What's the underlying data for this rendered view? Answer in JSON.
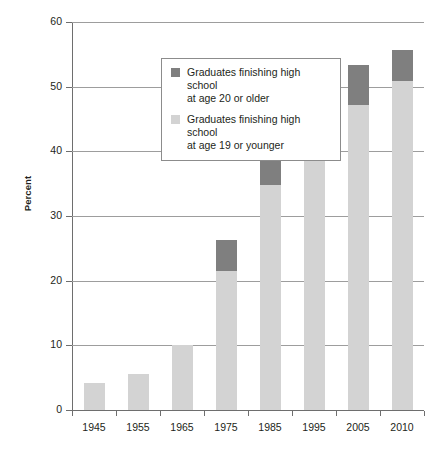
{
  "chart_data": {
    "type": "bar",
    "stacked": true,
    "title": "",
    "xlabel": "",
    "ylabel": "Percent",
    "ylim": [
      0,
      60
    ],
    "yticks": [
      0,
      10,
      20,
      30,
      40,
      50,
      60
    ],
    "ytick_labels": [
      "0",
      "10",
      "20",
      "30",
      "40",
      "50",
      "60"
    ],
    "grid": true,
    "grid_axis": "y",
    "legend_position": "upper-left-inside",
    "categories": [
      "1945",
      "1955",
      "1965",
      "1975",
      "1985",
      "1995",
      "2005",
      "2010"
    ],
    "series": [
      {
        "name": "Graduates finishing high school at age 19 or younger",
        "color": "#d3d3d3",
        "values": [
          4.2,
          5.6,
          10.0,
          21.5,
          34.8,
          45.3,
          47.2,
          50.9
        ]
      },
      {
        "name": "Graduates finishing high school at age 20 or older",
        "color": "#7f7f7f",
        "values": [
          0.0,
          0.0,
          0.0,
          4.8,
          4.0,
          6.0,
          6.2,
          4.7
        ]
      }
    ],
    "totals": [
      4.2,
      5.6,
      10.0,
      26.3,
      38.8,
      51.3,
      53.4,
      55.6
    ]
  },
  "legend": {
    "entries": [
      {
        "swatch": "dark",
        "line1": "Graduates finishing high school",
        "line2": "at age 20 or older"
      },
      {
        "swatch": "light",
        "line1": "Graduates finishing high school",
        "line2": "at age 19 or younger"
      }
    ]
  },
  "axes": {
    "y_title": "Percent"
  },
  "colors": {
    "segment_low": "#d3d3d3",
    "segment_high": "#7f7f7f",
    "gridline": "#9d9d9d",
    "axis": "#6e6e6e",
    "text": "#231f20",
    "legend_border": "#8c8c8c",
    "background": "#ffffff"
  }
}
